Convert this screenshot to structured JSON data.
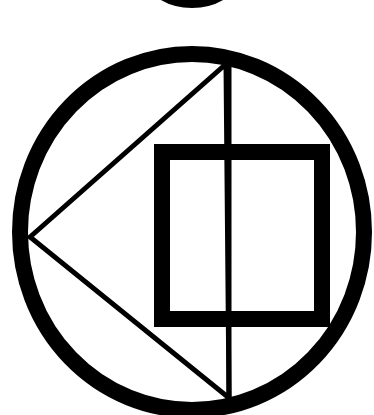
{
  "figure": {
    "title": "Circle with inscribed triangle and square symbol",
    "colors": {
      "background": "#ffffff",
      "stroke": "#000000"
    },
    "shapes": {
      "top_arc": {
        "cx": 192,
        "cy": -40,
        "rx": 52,
        "ry": 44,
        "stroke_width": 8
      },
      "outer_circle": {
        "cx": 192,
        "cy": 232,
        "rx": 172,
        "ry": 178,
        "stroke_width": 16
      },
      "triangle": {
        "points": "30,237 226,64 229,398",
        "stroke_width": 5
      },
      "vertical_line": {
        "x": 229,
        "y1": 64,
        "y2": 398,
        "stroke_width": 5
      },
      "square": {
        "x": 162,
        "y": 152,
        "width": 160,
        "height": 167,
        "stroke_width": 16
      }
    }
  }
}
